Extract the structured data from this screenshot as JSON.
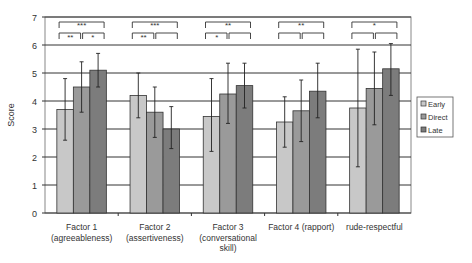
{
  "chart_data": {
    "type": "bar",
    "title": "",
    "xlabel": "",
    "ylabel": "Score",
    "ylim": [
      0,
      7
    ],
    "yticks": [
      0,
      1,
      2,
      3,
      4,
      5,
      6,
      7
    ],
    "grid": true,
    "legend_position": "right",
    "categories": [
      [
        "Factor 1",
        "(agreeableness)"
      ],
      [
        "Factor 2",
        "(assertiveness)"
      ],
      [
        "Factor 3",
        "(conversational",
        "skill)"
      ],
      [
        "Factor 4 (rapport)"
      ],
      [
        "rude-respectful"
      ]
    ],
    "series": [
      {
        "name": "Early",
        "color": "#c8c8c8",
        "values": [
          3.7,
          4.2,
          3.45,
          3.25,
          3.75
        ],
        "err_low": [
          2.6,
          3.4,
          2.2,
          2.35,
          1.65
        ],
        "err_high": [
          4.8,
          5.0,
          4.8,
          4.15,
          5.85
        ]
      },
      {
        "name": "Direct",
        "color": "#9a9a9a",
        "values": [
          4.5,
          3.6,
          4.25,
          3.65,
          4.45
        ],
        "err_low": [
          3.6,
          2.7,
          3.2,
          2.55,
          3.15
        ],
        "err_high": [
          5.4,
          4.5,
          5.35,
          4.75,
          5.75
        ]
      },
      {
        "name": "Late",
        "color": "#7c7c7c",
        "values": [
          5.1,
          3.0,
          4.55,
          4.35,
          5.15
        ],
        "err_low": [
          4.5,
          2.3,
          3.75,
          3.4,
          4.2
        ],
        "err_high": [
          5.7,
          3.8,
          5.35,
          5.35,
          6.05
        ]
      }
    ],
    "significance": [
      {
        "category": 0,
        "top": "***",
        "left": "**",
        "right": "*"
      },
      {
        "category": 1,
        "top": "***",
        "left": "**",
        "right": ""
      },
      {
        "category": 2,
        "top": "**",
        "left": "*",
        "right": ""
      },
      {
        "category": 3,
        "top": "**",
        "left": "",
        "right": ""
      },
      {
        "category": 4,
        "top": "*",
        "left": "",
        "right": ""
      }
    ]
  }
}
